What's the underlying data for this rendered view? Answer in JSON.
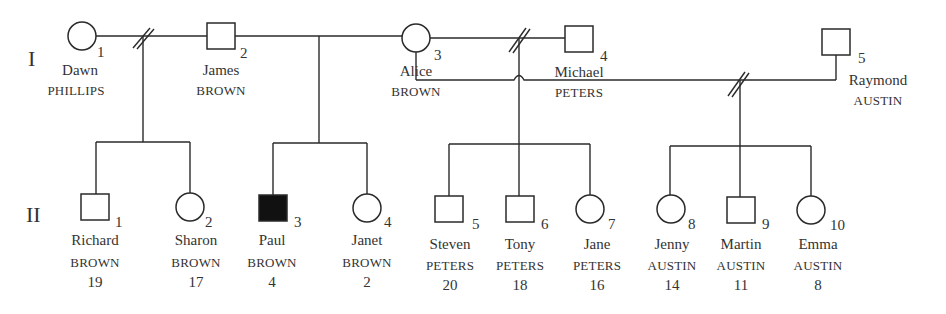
{
  "colors": {
    "line": "#2a2a2a",
    "affected": "#111111",
    "text": "#333333",
    "background": "#ffffff"
  },
  "generations": [
    {
      "label": "I",
      "members": [
        {
          "id": "I-1",
          "number": "1",
          "given": "Dawn",
          "surname": "PHILLIPS",
          "sex": "female",
          "affected": false
        },
        {
          "id": "I-2",
          "number": "2",
          "given": "James",
          "surname": "BROWN",
          "sex": "male",
          "affected": false
        },
        {
          "id": "I-3",
          "number": "3",
          "given": "Alice",
          "surname": "BROWN",
          "sex": "female",
          "affected": false
        },
        {
          "id": "I-4",
          "number": "4",
          "given": "Michael",
          "surname": "PETERS",
          "sex": "male",
          "affected": false
        },
        {
          "id": "I-5",
          "number": "5",
          "given": "Raymond",
          "surname": "AUSTIN",
          "sex": "male",
          "affected": false
        }
      ]
    },
    {
      "label": "II",
      "members": [
        {
          "id": "II-1",
          "number": "1",
          "given": "Richard",
          "surname": "BROWN",
          "age": "19",
          "sex": "male",
          "affected": false
        },
        {
          "id": "II-2",
          "number": "2",
          "given": "Sharon",
          "surname": "BROWN",
          "age": "17",
          "sex": "female",
          "affected": false
        },
        {
          "id": "II-3",
          "number": "3",
          "given": "Paul",
          "surname": "BROWN",
          "age": "4",
          "sex": "male",
          "affected": true
        },
        {
          "id": "II-4",
          "number": "4",
          "given": "Janet",
          "surname": "BROWN",
          "age": "2",
          "sex": "female",
          "affected": false
        },
        {
          "id": "II-5",
          "number": "5",
          "given": "Steven",
          "surname": "PETERS",
          "age": "20",
          "sex": "male",
          "affected": false
        },
        {
          "id": "II-6",
          "number": "6",
          "given": "Tony",
          "surname": "PETERS",
          "age": "18",
          "sex": "male",
          "affected": false
        },
        {
          "id": "II-7",
          "number": "7",
          "given": "Jane",
          "surname": "PETERS",
          "age": "16",
          "sex": "female",
          "affected": false
        },
        {
          "id": "II-8",
          "number": "8",
          "given": "Jenny",
          "surname": "AUSTIN",
          "age": "14",
          "sex": "female",
          "affected": false
        },
        {
          "id": "II-9",
          "number": "9",
          "given": "Martin",
          "surname": "AUSTIN",
          "age": "11",
          "sex": "male",
          "affected": false
        },
        {
          "id": "II-10",
          "number": "10",
          "given": "Emma",
          "surname": "AUSTIN",
          "age": "8",
          "sex": "female",
          "affected": false
        }
      ]
    }
  ],
  "unions": [
    {
      "partners": [
        "I-1",
        "I-2"
      ],
      "status": "divorced",
      "children": [
        "II-1",
        "II-2"
      ]
    },
    {
      "partners": [
        "I-2",
        "I-3"
      ],
      "status": "married",
      "children": [
        "II-3",
        "II-4"
      ]
    },
    {
      "partners": [
        "I-3",
        "I-4"
      ],
      "status": "divorced",
      "children": [
        "II-5",
        "II-6",
        "II-7"
      ]
    },
    {
      "partners": [
        "I-3",
        "I-5"
      ],
      "status": "divorced",
      "children": [
        "II-8",
        "II-9",
        "II-10"
      ]
    }
  ]
}
